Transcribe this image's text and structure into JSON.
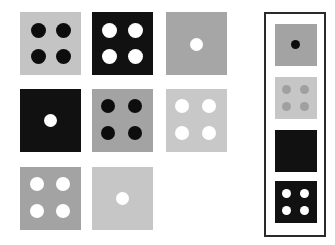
{
  "puzzle": {
    "type": "matrix-reasoning",
    "grid": [
      {
        "row": 0,
        "col": 0,
        "bg": "#c4c4c4",
        "dot_color": "#0d0d0d",
        "dots": 4
      },
      {
        "row": 0,
        "col": 1,
        "bg": "#111111",
        "dot_color": "#ffffff",
        "dots": 4
      },
      {
        "row": 0,
        "col": 2,
        "bg": "#a6a6a6",
        "dot_color": "#ffffff",
        "dots": 1
      },
      {
        "row": 1,
        "col": 0,
        "bg": "#111111",
        "dot_color": "#ffffff",
        "dots": 1
      },
      {
        "row": 1,
        "col": 1,
        "bg": "#a3a3a3",
        "dot_color": "#0d0d0d",
        "dots": 4
      },
      {
        "row": 1,
        "col": 2,
        "bg": "#c8c8c8",
        "dot_color": "#ffffff",
        "dots": 4
      },
      {
        "row": 2,
        "col": 0,
        "bg": "#a3a3a3",
        "dot_color": "#ffffff",
        "dots": 4
      },
      {
        "row": 2,
        "col": 1,
        "bg": "#c6c6c6",
        "dot_color": "#ffffff",
        "dots": 1
      },
      {
        "row": 2,
        "col": 2,
        "bg": null,
        "dot_color": null,
        "dots": 0,
        "missing": true
      }
    ],
    "options": [
      {
        "index": 0,
        "bg": "#a3a3a3",
        "dot_color": "#0d0d0d",
        "dots": 1
      },
      {
        "index": 1,
        "bg": "#c6c6c6",
        "dot_color": "#a0a0a0",
        "dots": 4
      },
      {
        "index": 2,
        "bg": "#111111",
        "dot_color": null,
        "dots": 0
      },
      {
        "index": 3,
        "bg": "#111111",
        "dot_color": "#ffffff",
        "dots": 4
      }
    ]
  }
}
